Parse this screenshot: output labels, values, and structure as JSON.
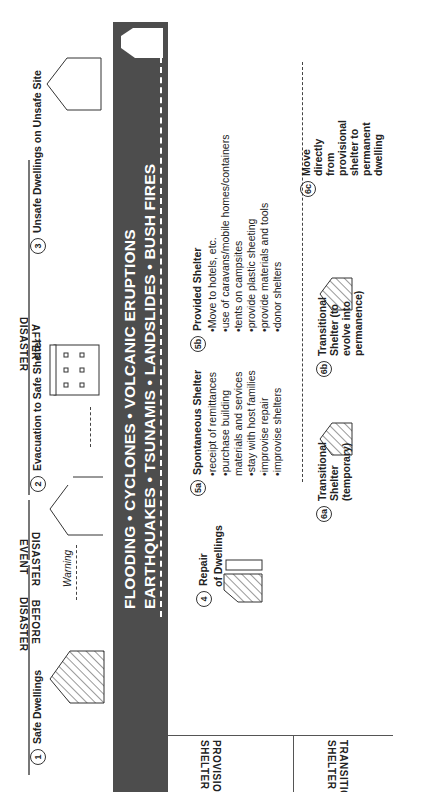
{
  "stages": [
    {
      "num": "1",
      "label": "Safe Dwellings"
    },
    {
      "num": "2",
      "label": "Evacuation to Safe Shelter"
    },
    {
      "num": "3",
      "label": "Unsafe Dwellings on Unsafe Site"
    }
  ],
  "warning_label": "Warning",
  "disaster_band": {
    "line1": "FLOODING • CYCLONES • VOLCANIC ERUPTIONS",
    "line2": "EARTHQUAKES • TSUNAMIS • LANDSLIDES • BUSH FIRES"
  },
  "repair": {
    "num": "4",
    "line1": "Repair",
    "line2": "of Dwellings"
  },
  "spontaneous": {
    "num": "5a",
    "title": "Spontaneous Shelter",
    "items": [
      "receipt of remittances",
      "purchase building materials and services",
      "stay with host families",
      "improvise repair",
      "improvise shelters"
    ]
  },
  "provided": {
    "num": "5b",
    "title": "Provided Shelter",
    "items": [
      "Move to hotels, etc.",
      "use of caravans/mobile homes/containers",
      "tents on campsites",
      "provide plastic sheeting",
      "provide materials and tools",
      "donor shelters"
    ]
  },
  "transitional": [
    {
      "num": "6a",
      "lines": [
        "Transitional",
        "Shelter",
        "(temporary)"
      ]
    },
    {
      "num": "6b",
      "lines": [
        "Transitional",
        "Shelter (to",
        "evolve into",
        "permanence)"
      ]
    },
    {
      "num": "6c",
      "lines": [
        "Move",
        "directly",
        "from",
        "provisional",
        "shelter to",
        "permanent",
        "dwelling"
      ]
    }
  ],
  "row_labels": {
    "provisional": [
      "PROVISIONAL",
      "SHELTER"
    ],
    "transitional": [
      "TRANSITIONAL",
      "SHELTER"
    ]
  },
  "phase_labels": {
    "before": [
      "BEFORE",
      "DISASTER"
    ],
    "event": [
      "DISASTER",
      "EVENT"
    ],
    "after": [
      "AFTER",
      "DISASTER"
    ]
  },
  "colors": {
    "band": "#4d4d4d",
    "line": "#444444",
    "arrow": "#777777"
  }
}
